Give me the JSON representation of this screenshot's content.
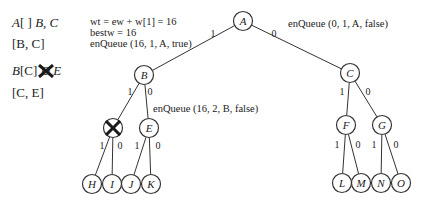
{
  "left_list": [
    {
      "pre_italic": "A",
      "text": "[ ] ",
      "post_italic": "B, C"
    },
    {
      "text": "[B, C]"
    },
    {
      "pre_italic": "B",
      "text": "[C] ",
      "crossed": "D",
      "post_italic": " E"
    },
    {
      "text": "[C, E]"
    }
  ],
  "annotations": {
    "wt": "wt = ew + w[1] = 16",
    "bestw": "bestw = 16",
    "enqueue_true": "enQueue (16, 1, A, true)",
    "enqueue_A_false": "enQueue (0, 1, A, false)",
    "enqueue_B_false": "enQueue (16, 2, B, false)"
  },
  "nodes": [
    {
      "id": "A",
      "x": 243,
      "y": 21
    },
    {
      "id": "B",
      "x": 144,
      "y": 75
    },
    {
      "id": "C",
      "x": 350,
      "y": 73
    },
    {
      "id": "D",
      "x": 113,
      "y": 128,
      "crossed": true
    },
    {
      "id": "E",
      "x": 149,
      "y": 128
    },
    {
      "id": "F",
      "x": 346,
      "y": 125
    },
    {
      "id": "G",
      "x": 382,
      "y": 125
    },
    {
      "id": "H",
      "x": 92,
      "y": 184
    },
    {
      "id": "I",
      "x": 112,
      "y": 184
    },
    {
      "id": "J",
      "x": 131,
      "y": 184
    },
    {
      "id": "K",
      "x": 151,
      "y": 184
    },
    {
      "id": "L",
      "x": 342,
      "y": 183
    },
    {
      "id": "M",
      "x": 361,
      "y": 183
    },
    {
      "id": "N",
      "x": 381,
      "y": 183
    },
    {
      "id": "O",
      "x": 401,
      "y": 183
    }
  ],
  "edges": [
    {
      "from": "A",
      "to": "B",
      "label": "1",
      "lx": 213,
      "ly": 33
    },
    {
      "from": "A",
      "to": "C",
      "label": "0",
      "lx": 274,
      "ly": 33
    },
    {
      "from": "B",
      "to": "D",
      "label": "1",
      "lx": 130,
      "ly": 91
    },
    {
      "from": "B",
      "to": "E",
      "label": "0",
      "lx": 150,
      "ly": 91
    },
    {
      "from": "C",
      "to": "F",
      "label": "1",
      "lx": 342,
      "ly": 91
    },
    {
      "from": "C",
      "to": "G",
      "label": "0",
      "lx": 368,
      "ly": 91
    },
    {
      "from": "D",
      "to": "H",
      "label": "1",
      "lx": 102,
      "ly": 145
    },
    {
      "from": "D",
      "to": "I",
      "label": "0",
      "lx": 120,
      "ly": 145
    },
    {
      "from": "E",
      "to": "J",
      "label": "1",
      "lx": 137,
      "ly": 145
    },
    {
      "from": "E",
      "to": "K",
      "label": "0",
      "lx": 158,
      "ly": 145
    },
    {
      "from": "F",
      "to": "L",
      "label": "1",
      "lx": 337,
      "ly": 144
    },
    {
      "from": "F",
      "to": "M",
      "label": "0",
      "lx": 358,
      "ly": 144
    },
    {
      "from": "G",
      "to": "N",
      "label": "1",
      "lx": 374,
      "ly": 144
    },
    {
      "from": "G",
      "to": "O",
      "label": "0",
      "lx": 396,
      "ly": 144
    }
  ],
  "colors": {
    "stroke": "#333333",
    "text": "#222222",
    "cross": "#1a1a1a"
  }
}
